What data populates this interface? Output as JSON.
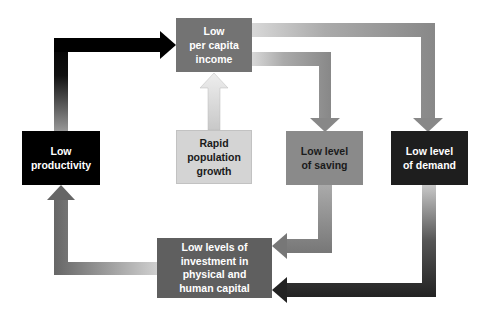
{
  "diagram": {
    "type": "vicious circle of poverty",
    "nodes": [
      {
        "id": "income",
        "label": "Low\nper capita\nincome",
        "lines": [
          "Low",
          "per capita",
          "income"
        ],
        "fill": "#737373",
        "text_color": "#ffffff"
      },
      {
        "id": "population",
        "label": "Rapid population growth",
        "lines": [
          "Rapid",
          "population",
          "growth"
        ],
        "fill": "#d4d4d4",
        "text_color": "#1a1a1a"
      },
      {
        "id": "saving",
        "label": "Low level of saving",
        "lines": [
          "Low level",
          "of saving"
        ],
        "fill": "#8a8a8a",
        "text_color": "#1a1a1a"
      },
      {
        "id": "demand",
        "label": "Low level of demand",
        "lines": [
          "Low level",
          "of demand"
        ],
        "fill": "#1e1e1e",
        "text_color": "#ffffff"
      },
      {
        "id": "investment",
        "label": "Low levels of investment in physical and human capital",
        "lines": [
          "Low levels of",
          "investment in",
          "physical and",
          "human capital"
        ],
        "fill": "#5f5f5f",
        "text_color": "#ffffff"
      },
      {
        "id": "productivity",
        "label": "Low productivity",
        "lines": [
          "Low",
          "productivity"
        ],
        "fill": "#000000",
        "text_color": "#ffffff"
      }
    ],
    "edges": [
      {
        "from": "productivity",
        "to": "income"
      },
      {
        "from": "population",
        "to": "income"
      },
      {
        "from": "income",
        "to": "saving"
      },
      {
        "from": "income",
        "to": "demand"
      },
      {
        "from": "saving",
        "to": "investment"
      },
      {
        "from": "demand",
        "to": "investment"
      },
      {
        "from": "investment",
        "to": "productivity"
      }
    ]
  }
}
